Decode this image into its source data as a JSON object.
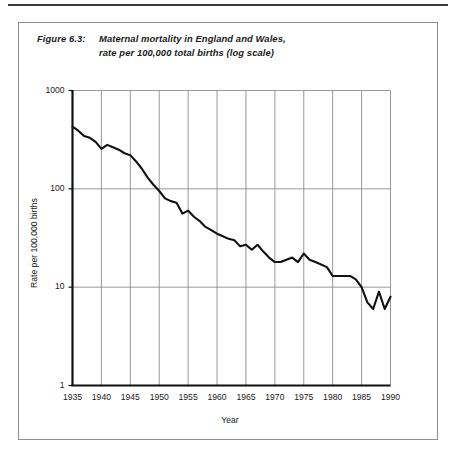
{
  "figure": {
    "number": "Figure 6.3:",
    "caption_line1": "Maternal mortality in England and Wales,",
    "caption_line2": "rate per 100,000 total births (log scale)"
  },
  "axes": {
    "y_ticks": [
      "1000",
      "100",
      "10",
      "1"
    ],
    "x_ticks": [
      "1935",
      "1940",
      "1945",
      "1950",
      "1955",
      "1960",
      "1965",
      "1970",
      "1975",
      "1980",
      "1985",
      "1990"
    ],
    "y_label": "Rate per 100,000 births",
    "x_label": "Year"
  },
  "colors": {
    "line": "#111111",
    "grid": "#8c8c8c",
    "axis": "#111111",
    "frame": "#8d8d8d",
    "rule": "#3b3b3b",
    "text": "#1a1a1a"
  },
  "chart_data": {
    "type": "line",
    "title": "Maternal mortality in England and Wales, rate per 100,000 total births (log scale)",
    "xlabel": "Year",
    "ylabel": "Rate per 100,000 births",
    "yscale": "log",
    "ylim": [
      1,
      1000
    ],
    "xlim": [
      1935,
      1990
    ],
    "grid": true,
    "legend": false,
    "x": [
      1935,
      1936,
      1937,
      1938,
      1939,
      1940,
      1941,
      1942,
      1943,
      1944,
      1945,
      1946,
      1947,
      1948,
      1949,
      1950,
      1951,
      1952,
      1953,
      1954,
      1955,
      1956,
      1957,
      1958,
      1959,
      1960,
      1961,
      1962,
      1963,
      1964,
      1965,
      1966,
      1967,
      1968,
      1969,
      1970,
      1971,
      1972,
      1973,
      1974,
      1975,
      1976,
      1977,
      1978,
      1979,
      1980,
      1981,
      1982,
      1983,
      1984,
      1985,
      1986,
      1987,
      1988,
      1989,
      1990
    ],
    "values": [
      430,
      390,
      345,
      330,
      300,
      255,
      280,
      265,
      250,
      230,
      220,
      190,
      160,
      130,
      110,
      95,
      80,
      75,
      72,
      56,
      60,
      52,
      47,
      41,
      38,
      35,
      33,
      31,
      30,
      26,
      27,
      24,
      27,
      23,
      20,
      18,
      18,
      19,
      20,
      18,
      22,
      19,
      18,
      17,
      16,
      13,
      13,
      13,
      13,
      12,
      10,
      7,
      6,
      9,
      6,
      8
    ],
    "units": "deaths per 100,000 total births",
    "series_name": "Maternal mortality rate"
  }
}
